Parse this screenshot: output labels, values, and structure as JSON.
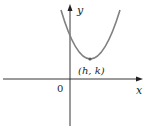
{
  "diagram": {
    "type": "parabola-graph",
    "axes": {
      "x_label": "x",
      "y_label": "y",
      "origin_label": "0"
    },
    "curve": {
      "kind": "parabola",
      "opens": "up",
      "color": "#808080"
    },
    "vertex": {
      "label": "(h, k)"
    },
    "colors": {
      "axis": "#231f20",
      "curve": "#808080",
      "vertex_point": "#5a5a5a"
    }
  }
}
